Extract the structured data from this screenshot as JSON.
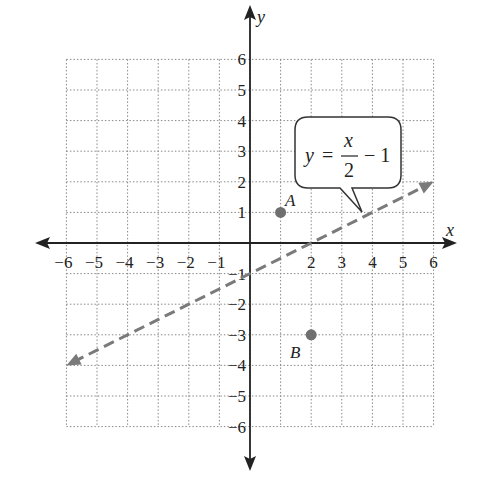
{
  "chart_data": {
    "type": "line",
    "title": "",
    "xlabel": "x",
    "ylabel": "y",
    "xlim": [
      -6,
      6
    ],
    "ylim": [
      -6,
      6
    ],
    "grid": true,
    "x_ticks": [
      "-6",
      "-5",
      "-4",
      "-3",
      "-2",
      "-1",
      "2",
      "3",
      "4",
      "5",
      "6"
    ],
    "y_ticks": [
      "6",
      "5",
      "4",
      "3",
      "2",
      "1",
      "-1",
      "-2",
      "-3",
      "-4",
      "-5",
      "-6"
    ],
    "series": [
      {
        "name": "y = x/2 - 1",
        "style": "dashed",
        "color": "#7a7a7a",
        "x": [
          -6,
          6
        ],
        "y": [
          -4,
          2
        ],
        "arrows": "both"
      }
    ],
    "points": [
      {
        "label": "A",
        "x": 1,
        "y": 1,
        "color": "#6f6f6f"
      },
      {
        "label": "B",
        "x": 2,
        "y": -3,
        "color": "#6f6f6f"
      }
    ],
    "annotations": [
      {
        "type": "callout",
        "text": "y = x/2 - 1",
        "pointing_to": [
          3.7,
          0.85
        ]
      }
    ]
  },
  "labels": {
    "x_axis": "x",
    "y_axis": "y",
    "point_a": "A",
    "point_b": "B",
    "eq_y": "y",
    "eq_equals": "=",
    "eq_num": "x",
    "eq_den": "2",
    "eq_tail": "− 1"
  },
  "x_tick_labels": [
    "−6",
    "−5",
    "−4",
    "−3",
    "−2",
    "−1",
    "2",
    "3",
    "4",
    "5",
    "6"
  ],
  "y_tick_labels": [
    "6",
    "5",
    "4",
    "3",
    "2",
    "1",
    "−1",
    "−2",
    "−3",
    "−4",
    "−5",
    "−6"
  ]
}
